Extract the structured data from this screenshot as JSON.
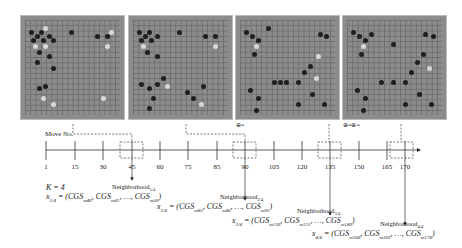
{
  "boards": [
    {
      "label": "board-move-45",
      "left": 20
    },
    {
      "label": "board-move-90",
      "left": 128
    },
    {
      "label": "board-move-135",
      "left": 235
    },
    {
      "label": "board-move-170",
      "left": 342
    }
  ],
  "timeline": {
    "axis_label": "Move No.",
    "ticks": [
      "1",
      "15",
      "30",
      "45",
      "60",
      "75",
      "90",
      "105",
      "120",
      "135",
      "150",
      "165",
      "170"
    ],
    "highlighted": [
      "45",
      "90",
      "135",
      "170"
    ]
  },
  "annotations": {
    "m90_marker": "⊕=",
    "m135_marker": "⊕=⊕="
  },
  "formulas": {
    "k": "K = 4",
    "x1": {
      "lhs": "x",
      "sub": "1/4",
      "body": " = (CGS",
      "terms": [
        "m40",
        "m41",
        "m50"
      ]
    },
    "x2": {
      "lhs": "x",
      "sub": "2/4",
      "terms": [
        "m85",
        "m86",
        "m95"
      ]
    },
    "x3": {
      "lhs": "x",
      "sub": "3/4",
      "terms": [
        "m130",
        "m131",
        "m140"
      ]
    },
    "x4": {
      "lhs": "x",
      "sub": "4/4",
      "terms": [
        "m168",
        "m169",
        "m178"
      ]
    },
    "neighborhoods": [
      {
        "label": "Neighborhood",
        "sub": "1/4"
      },
      {
        "label": "Neighborhood",
        "sub": "2/4"
      },
      {
        "label": "Neighborhood",
        "sub": "3/4"
      },
      {
        "label": "Neighborhood",
        "sub": "4/4"
      }
    ]
  }
}
